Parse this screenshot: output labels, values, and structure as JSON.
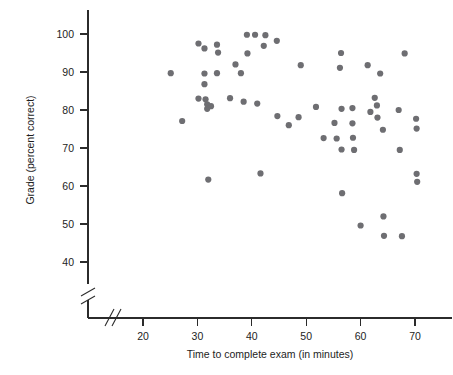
{
  "chart_data": {
    "type": "scatter",
    "title": "",
    "xlabel": "Time to complete exam (in minutes)",
    "ylabel": "Grade (percent correct)",
    "xlim": [
      15,
      76
    ],
    "ylim": [
      38,
      103
    ],
    "xticks": [
      20,
      30,
      40,
      50,
      60,
      70
    ],
    "xtick_labels": [
      "20",
      "30",
      "40",
      "50",
      "60",
      "70"
    ],
    "yticks": [
      40,
      50,
      60,
      70,
      80,
      90,
      100
    ],
    "ytick_labels": [
      "40",
      "50",
      "60",
      "70",
      "80",
      "90",
      "100"
    ],
    "grid": false,
    "legend": null,
    "axis_break_x": true,
    "axis_break_y": true,
    "marker_color": "#6e6e72",
    "marker_size": 3.1,
    "series": [
      {
        "name": "Students",
        "points": [
          [
            25.1,
            89.7
          ],
          [
            27.2,
            77.1
          ],
          [
            30.2,
            97.5
          ],
          [
            30.2,
            83.0
          ],
          [
            31.3,
            96.2
          ],
          [
            31.3,
            89.6
          ],
          [
            31.3,
            86.8
          ],
          [
            31.5,
            82.8
          ],
          [
            31.8,
            81.5
          ],
          [
            31.8,
            80.3
          ],
          [
            32.0,
            61.7
          ],
          [
            32.5,
            81.0
          ],
          [
            33.6,
            97.2
          ],
          [
            33.6,
            89.7
          ],
          [
            33.8,
            95.1
          ],
          [
            36.0,
            83.1
          ],
          [
            37.0,
            92.0
          ],
          [
            38.0,
            89.7
          ],
          [
            38.5,
            82.2
          ],
          [
            39.1,
            99.8
          ],
          [
            39.2,
            94.9
          ],
          [
            40.6,
            99.8
          ],
          [
            41.0,
            81.7
          ],
          [
            41.6,
            63.3
          ],
          [
            42.2,
            96.9
          ],
          [
            42.5,
            99.7
          ],
          [
            44.6,
            98.2
          ],
          [
            44.7,
            78.4
          ],
          [
            46.8,
            76.0
          ],
          [
            48.6,
            78.1
          ],
          [
            49.0,
            91.8
          ],
          [
            51.8,
            80.8
          ],
          [
            53.2,
            72.6
          ],
          [
            55.2,
            76.6
          ],
          [
            55.6,
            72.5
          ],
          [
            56.2,
            91.1
          ],
          [
            56.4,
            95.0
          ],
          [
            56.5,
            80.3
          ],
          [
            56.5,
            69.6
          ],
          [
            56.6,
            58.1
          ],
          [
            58.5,
            80.5
          ],
          [
            58.5,
            76.5
          ],
          [
            58.6,
            72.7
          ],
          [
            58.8,
            69.5
          ],
          [
            60.0,
            49.6
          ],
          [
            61.3,
            91.8
          ],
          [
            61.8,
            79.5
          ],
          [
            62.6,
            83.2
          ],
          [
            63.0,
            81.2
          ],
          [
            63.1,
            78.0
          ],
          [
            63.6,
            89.6
          ],
          [
            64.1,
            74.8
          ],
          [
            64.2,
            52.0
          ],
          [
            64.3,
            46.9
          ],
          [
            67.0,
            80.0
          ],
          [
            67.2,
            69.5
          ],
          [
            67.6,
            46.8
          ],
          [
            68.1,
            94.9
          ],
          [
            70.2,
            77.7
          ],
          [
            70.3,
            75.1
          ],
          [
            70.3,
            63.2
          ],
          [
            70.4,
            61.1
          ]
        ]
      }
    ]
  }
}
